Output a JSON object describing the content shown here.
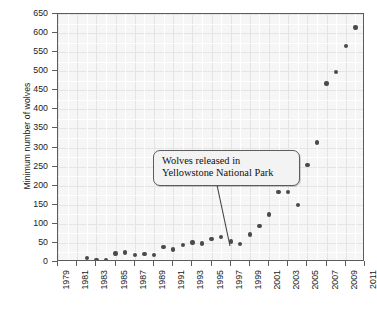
{
  "chart_data": {
    "type": "scatter",
    "title": "",
    "xlabel": "",
    "ylabel": "Minimum number of wolves",
    "xlim": [
      1979,
      2011
    ],
    "ylim": [
      0,
      650
    ],
    "grid": true,
    "legend": null,
    "x_tick_labels": [
      "1979",
      "1981",
      "1983",
      "1985",
      "1987",
      "1989",
      "1991",
      "1993",
      "1995",
      "1997",
      "1999",
      "2001",
      "2003",
      "2005",
      "2007",
      "2009",
      "2011"
    ],
    "y_tick_labels": [
      "0",
      "50",
      "100",
      "150",
      "200",
      "250",
      "300",
      "350",
      "400",
      "450",
      "500",
      "550",
      "600",
      "650"
    ],
    "y_ticks": [
      0,
      50,
      100,
      150,
      200,
      250,
      300,
      350,
      400,
      450,
      500,
      550,
      600,
      650
    ],
    "x_ticks": [
      1979,
      1981,
      1983,
      1985,
      1987,
      1989,
      1991,
      1993,
      1995,
      1997,
      1999,
      2001,
      2003,
      2005,
      2007,
      2009,
      2011
    ],
    "series": [
      {
        "name": "Minimum number of wolves",
        "color": "#4a4a4a",
        "points": [
          {
            "x": 1982,
            "y": 10
          },
          {
            "x": 1983,
            "y": 6
          },
          {
            "x": 1984,
            "y": 5
          },
          {
            "x": 1985,
            "y": 22
          },
          {
            "x": 1986,
            "y": 25
          },
          {
            "x": 1987,
            "y": 18
          },
          {
            "x": 1988,
            "y": 21
          },
          {
            "x": 1989,
            "y": 18
          },
          {
            "x": 1990,
            "y": 39
          },
          {
            "x": 1991,
            "y": 33
          },
          {
            "x": 1992,
            "y": 45
          },
          {
            "x": 1993,
            "y": 51
          },
          {
            "x": 1994,
            "y": 48
          },
          {
            "x": 1995,
            "y": 60
          },
          {
            "x": 1996,
            "y": 66
          },
          {
            "x": 1997,
            "y": 54
          },
          {
            "x": 1998,
            "y": 47
          },
          {
            "x": 1999,
            "y": 72
          },
          {
            "x": 2000,
            "y": 94
          },
          {
            "x": 2001,
            "y": 125
          },
          {
            "x": 2002,
            "y": 184
          },
          {
            "x": 2003,
            "y": 184
          },
          {
            "x": 2004,
            "y": 150
          },
          {
            "x": 2005,
            "y": 255
          },
          {
            "x": 2006,
            "y": 313
          },
          {
            "x": 2007,
            "y": 468
          },
          {
            "x": 2008,
            "y": 498
          },
          {
            "x": 2009,
            "y": 566
          },
          {
            "x": 2010,
            "y": 615
          },
          {
            "x": 2011,
            "y": 652
          }
        ]
      }
    ],
    "annotations": [
      {
        "text_line1": "Wolves released in",
        "text_line2": "Yellowstone National Park",
        "target_x": 1997.6,
        "target_y": 48
      }
    ]
  },
  "colors": {
    "point": "#4a4a4a",
    "axis": "#5c5c5c",
    "plot_background": "#f6f6f6",
    "gridline": "#e3e3e3",
    "text": "#1a1a1a",
    "annotation_background": "#f3f3f3"
  }
}
